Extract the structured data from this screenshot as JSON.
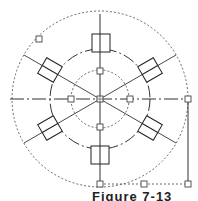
{
  "figure": {
    "caption": "Figure 7-13",
    "line_color": "#333333",
    "grip_color": "#555555",
    "center": [
      100,
      99
    ],
    "outer_dotted_circle_radius": 88,
    "middle_dashed_circle_radius": 50,
    "inner_dotted_circle_radius": 29,
    "bolt_count": 6,
    "bolt_angles_deg": [
      90,
      30,
      -30,
      -90,
      -150,
      150
    ],
    "grips": [
      [
        100,
        99
      ],
      [
        71,
        99
      ],
      [
        130,
        99
      ],
      [
        100,
        71
      ],
      [
        100,
        127
      ],
      [
        188,
        99
      ],
      [
        188,
        184
      ],
      [
        144,
        184
      ],
      [
        100,
        184
      ],
      [
        39,
        39
      ]
    ]
  }
}
